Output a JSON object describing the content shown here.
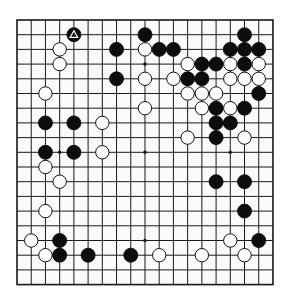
{
  "board": {
    "size": 19,
    "origin_x": 17,
    "origin_y": 20,
    "spacing_x": 14.22,
    "spacing_y": 14.7,
    "stone_radius": 7,
    "line_color": "#1a1a1a",
    "background": "#fafafa",
    "black_color": "#0d0d0d",
    "white_color": "#ffffff",
    "star_points": [
      [
        3,
        3
      ],
      [
        9,
        3
      ],
      [
        15,
        3
      ],
      [
        3,
        9
      ],
      [
        9,
        9
      ],
      [
        15,
        9
      ],
      [
        3,
        15
      ],
      [
        9,
        15
      ],
      [
        15,
        15
      ]
    ]
  },
  "last_move": {
    "col": 4,
    "row": 1,
    "marker": "triangle"
  },
  "stones": {
    "black": [
      [
        4,
        1
      ],
      [
        9,
        1
      ],
      [
        16,
        1
      ],
      [
        7,
        2
      ],
      [
        10,
        2
      ],
      [
        11,
        2
      ],
      [
        15,
        2
      ],
      [
        16,
        2
      ],
      [
        17,
        2
      ],
      [
        13,
        3
      ],
      [
        14,
        3
      ],
      [
        16,
        3
      ],
      [
        7,
        4
      ],
      [
        12,
        4
      ],
      [
        13,
        4
      ],
      [
        17,
        5
      ],
      [
        14,
        6
      ],
      [
        16,
        6
      ],
      [
        2,
        7
      ],
      [
        4,
        7
      ],
      [
        14,
        7
      ],
      [
        15,
        7
      ],
      [
        14,
        8
      ],
      [
        2,
        9
      ],
      [
        4,
        9
      ],
      [
        14,
        11
      ],
      [
        16,
        11
      ],
      [
        16,
        13
      ],
      [
        3,
        15
      ],
      [
        17,
        15
      ],
      [
        3,
        16
      ],
      [
        5,
        16
      ],
      [
        8,
        16
      ]
    ],
    "white": [
      [
        3,
        2
      ],
      [
        9,
        2
      ],
      [
        3,
        3
      ],
      [
        12,
        3
      ],
      [
        15,
        3
      ],
      [
        17,
        3
      ],
      [
        9,
        4
      ],
      [
        11,
        4
      ],
      [
        15,
        4
      ],
      [
        16,
        4
      ],
      [
        17,
        4
      ],
      [
        2,
        5
      ],
      [
        12,
        5
      ],
      [
        13,
        5
      ],
      [
        14,
        5
      ],
      [
        9,
        6
      ],
      [
        13,
        6
      ],
      [
        15,
        6
      ],
      [
        6,
        7
      ],
      [
        12,
        8
      ],
      [
        16,
        8
      ],
      [
        6,
        9
      ],
      [
        2,
        10
      ],
      [
        3,
        11
      ],
      [
        2,
        13
      ],
      [
        1,
        15
      ],
      [
        15,
        15
      ],
      [
        2,
        16
      ],
      [
        10,
        16
      ],
      [
        13,
        16
      ],
      [
        16,
        16
      ]
    ]
  }
}
